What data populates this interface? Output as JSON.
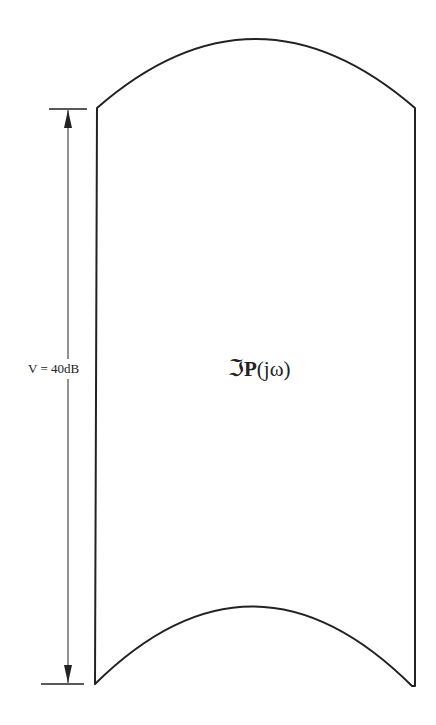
{
  "diagram": {
    "dimension_label": "V = 40dB",
    "template_label": {
      "operator_symbol": "ℑ",
      "plant_symbol": "P",
      "argument": "(jω)"
    },
    "colors": {
      "stroke": "#222222",
      "background": "#ffffff"
    },
    "shape": {
      "top_left": [
        97,
        108
      ],
      "top_peak": [
        255,
        38
      ],
      "top_right": [
        415,
        108
      ],
      "bottom_left": [
        95,
        684
      ],
      "bottom_peak": [
        253,
        607
      ],
      "bottom_right": [
        412,
        686
      ]
    },
    "dimension_line": {
      "x": 68,
      "y_top": 109,
      "y_bottom": 684
    }
  }
}
